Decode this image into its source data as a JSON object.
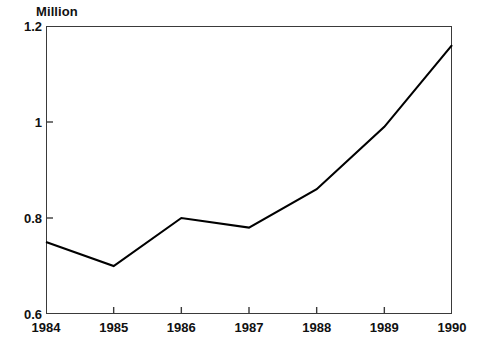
{
  "chart_data": {
    "type": "line",
    "title": "",
    "subtitle": "",
    "unit_label": "Million",
    "xlabel": "",
    "ylabel": "",
    "categories": [
      "1984",
      "1985",
      "1986",
      "1987",
      "1988",
      "1989",
      "1990"
    ],
    "x": [
      1984,
      1985,
      1986,
      1987,
      1988,
      1989,
      1990
    ],
    "values": [
      0.75,
      0.7,
      0.8,
      0.78,
      0.86,
      0.99,
      1.16
    ],
    "series": [
      {
        "name": "",
        "values": [
          0.75,
          0.7,
          0.8,
          0.78,
          0.86,
          0.99,
          1.16
        ]
      }
    ],
    "ylim": [
      0.6,
      1.2
    ],
    "xlim": [
      1984,
      1990
    ],
    "yticks": [
      0.6,
      0.8,
      1.0,
      1.2
    ],
    "ytick_labels": [
      "0.6",
      "0.8",
      "1",
      "1.2"
    ],
    "xticks": [
      1984,
      1985,
      1986,
      1987,
      1988,
      1989,
      1990
    ],
    "xtick_labels": [
      "1984",
      "1985",
      "1986",
      "1987",
      "1988",
      "1989",
      "1990"
    ],
    "grid": false,
    "legend": false,
    "legend_position": "none",
    "line_color": "#000000",
    "frame_color": "#3a3a3a",
    "background_color": "#ffffff",
    "tick_direction": "in"
  }
}
